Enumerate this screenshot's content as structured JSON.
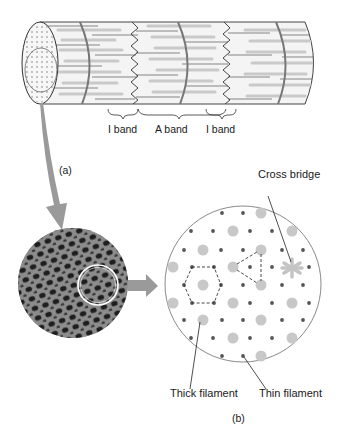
{
  "figure": {
    "panel_a": {
      "label": "(a)",
      "band_labels": [
        "I band",
        "A band",
        "I band"
      ],
      "description": "Muscle fiber cylinder showing myofibril bands"
    },
    "panel_b": {
      "label": "(b)",
      "callouts": {
        "cross_bridge": "Cross bridge",
        "thick_filament": "Thick filament",
        "thin_filament": "Thin filament"
      },
      "description": "Cross-section lattice of thick and thin filaments"
    }
  },
  "colors": {
    "outline": "#555555",
    "thick_filament": "#c8c8c8",
    "thin_filament": "#555555",
    "arrow": "#9a9a9a",
    "micrograph_dark": "#2a2a2a",
    "micrograph_light": "#8a8a8a"
  },
  "lattice": {
    "thin_dots": [
      [
        222,
        213
      ],
      [
        243,
        213
      ],
      [
        191,
        231
      ],
      [
        213,
        231
      ],
      [
        250,
        231
      ],
      [
        272,
        231
      ],
      [
        184,
        250
      ],
      [
        221,
        250
      ],
      [
        243,
        250
      ],
      [
        282,
        250
      ],
      [
        303,
        250
      ],
      [
        192,
        267
      ],
      [
        214,
        267
      ],
      [
        250,
        267
      ],
      [
        272,
        267
      ],
      [
        309,
        267
      ],
      [
        184,
        285
      ],
      [
        221,
        285
      ],
      [
        243,
        285
      ],
      [
        282,
        285
      ],
      [
        303,
        285
      ],
      [
        192,
        303
      ],
      [
        214,
        303
      ],
      [
        250,
        303
      ],
      [
        272,
        303
      ],
      [
        309,
        303
      ],
      [
        184,
        320
      ],
      [
        222,
        320
      ],
      [
        243,
        320
      ],
      [
        282,
        320
      ],
      [
        303,
        320
      ],
      [
        191,
        338
      ],
      [
        213,
        338
      ],
      [
        250,
        338
      ],
      [
        272,
        338
      ],
      [
        222,
        356
      ],
      [
        243,
        356
      ]
    ],
    "thick_dots": [
      [
        261,
        213
      ],
      [
        233,
        231
      ],
      [
        292,
        231
      ],
      [
        203,
        250
      ],
      [
        261,
        250
      ],
      [
        173,
        267
      ],
      [
        233,
        267
      ],
      [
        203,
        285
      ],
      [
        261,
        285
      ],
      [
        173,
        303
      ],
      [
        233,
        303
      ],
      [
        292,
        303
      ],
      [
        203,
        320
      ],
      [
        261,
        320
      ],
      [
        233,
        338
      ],
      [
        292,
        338
      ],
      [
        261,
        356
      ]
    ],
    "cross_bridge_center": [
      292,
      268
    ]
  }
}
